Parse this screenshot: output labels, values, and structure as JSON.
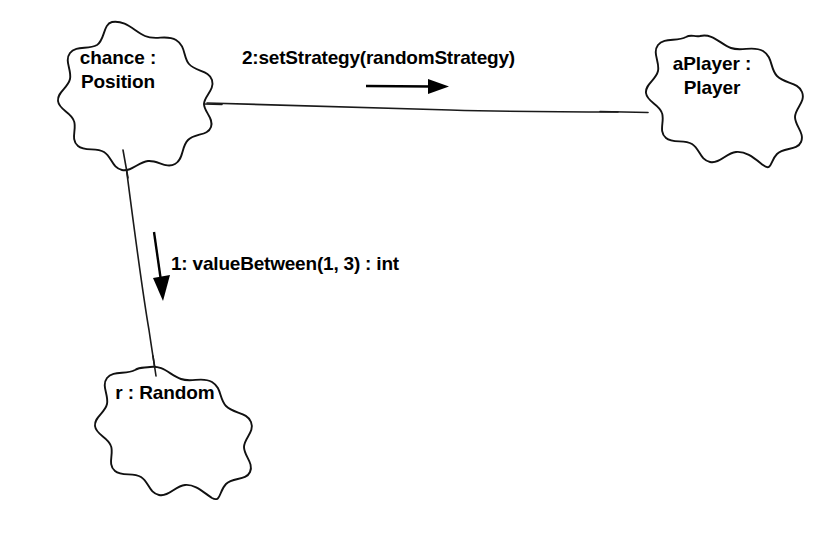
{
  "diagram": {
    "kind": "uml-collaboration-diagram",
    "background_color": "#ffffff",
    "stroke_color": "#111111",
    "text_color": "#000000",
    "width": 831,
    "height": 537,
    "nodes": [
      {
        "id": "chance",
        "shape": "cloud-blob",
        "label": "chance :\nPosition",
        "name_part": "chance",
        "type_part": "Position",
        "lines": [
          "chance :",
          "Position"
        ]
      },
      {
        "id": "aplayer",
        "shape": "cloud-blob",
        "label": "aPlayer :\nPlayer",
        "name_part": "aPlayer",
        "type_part": "Player",
        "lines": [
          "aPlayer :",
          "Player"
        ]
      },
      {
        "id": "random",
        "shape": "cloud-blob",
        "label": "r : Random",
        "name_part": "r",
        "type_part": "Random",
        "lines": [
          "r : Random"
        ]
      }
    ],
    "links": [
      {
        "id": "link-chance-aplayer",
        "from": "chance",
        "to": "aplayer",
        "style": "solid"
      },
      {
        "id": "link-chance-random",
        "from": "chance",
        "to": "random",
        "style": "solid"
      }
    ],
    "messages": [
      {
        "id": "message-2",
        "sequence": "2",
        "label": "2:setStrategy(randomStrategy)",
        "operation": "setStrategy",
        "arguments": "randomStrategy",
        "return_type": "",
        "direction": "right",
        "on_link": "link-chance-aplayer"
      },
      {
        "id": "message-1",
        "sequence": "1",
        "label": "1: valueBetween(1, 3) : int",
        "operation": "valueBetween",
        "arguments": "1, 3",
        "return_type": "int",
        "direction": "down",
        "on_link": "link-chance-random"
      }
    ]
  }
}
